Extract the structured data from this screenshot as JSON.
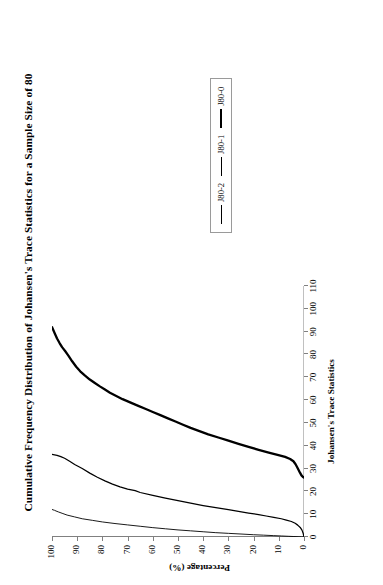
{
  "chart_data": {
    "type": "line",
    "title": "Cumulative Frequency Distribution of Johansen's Trace Statistics for a Sample Size of 80",
    "xlabel": "Johansen's Trace Statistics",
    "ylabel": "Percentage (%)",
    "xlim": [
      0,
      110
    ],
    "ylim": [
      0,
      100
    ],
    "xticks": [
      0,
      10,
      20,
      30,
      40,
      50,
      60,
      70,
      80,
      90,
      100,
      110
    ],
    "yticks": [
      0,
      10,
      20,
      30,
      40,
      50,
      60,
      70,
      80,
      90,
      100
    ],
    "grid": false,
    "legend_position": "right",
    "orientation": "rotated-90-ccw",
    "series": [
      {
        "name": "J80-2",
        "style": "thin",
        "x": [
          0.0,
          0.05,
          0.1,
          0.2,
          0.3,
          0.45,
          0.6,
          0.8,
          1.0,
          1.3,
          1.6,
          1.9,
          2.3,
          2.7,
          3.1,
          3.6,
          4.1,
          4.7,
          5.3,
          5.9,
          6.6,
          7.3,
          8.0,
          8.8,
          9.6,
          10.4,
          11.0,
          11.4,
          11.7,
          11.9,
          12.1
        ],
        "y": [
          0,
          1,
          2,
          4,
          6,
          9,
          12,
          16,
          20,
          25,
          30,
          35,
          40,
          45,
          50,
          55,
          60,
          65,
          70,
          75,
          80,
          84,
          88,
          91,
          94,
          96,
          97.5,
          98.4,
          99.0,
          99.6,
          100
        ]
      },
      {
        "name": "J80-1",
        "style": "medium",
        "x": [
          0.0,
          1.5,
          3.0,
          4.2,
          5.2,
          6.0,
          6.8,
          7.4,
          8.0,
          8.6,
          9.2,
          9.8,
          10.5,
          11.2,
          12.0,
          12.9,
          13.8,
          14.8,
          15.9,
          17.0,
          18.2,
          19.5,
          20.3,
          21.0,
          22.0,
          23.2,
          24.6,
          26.2,
          28.0,
          30.0,
          31.8,
          33.2,
          34.5,
          35.2,
          35.8,
          36.2
        ],
        "y": [
          0,
          0.3,
          0.8,
          1.5,
          2.5,
          3.5,
          5,
          7,
          9,
          12,
          15,
          18,
          22,
          26,
          30,
          35,
          40,
          45,
          50,
          55,
          60,
          65,
          67,
          70,
          73,
          76,
          79,
          82,
          85,
          88,
          91,
          93,
          95,
          96.5,
          98,
          100
        ]
      },
      {
        "name": "J80-0",
        "style": "thick",
        "x": [
          26.0,
          26.3,
          27.0,
          28.2,
          29.5,
          30.8,
          32.0,
          33.2,
          34.2,
          35.1,
          36.0,
          37.0,
          38.2,
          39.5,
          40.8,
          42.2,
          43.6,
          45.0,
          46.4,
          47.8,
          49.2,
          50.6,
          52.0,
          53.4,
          54.8,
          56.2,
          57.6,
          59.0,
          60.4,
          61.8,
          63.2,
          64.6,
          66.0,
          67.5,
          69.0,
          70.8,
          72.6,
          74.6,
          77.0,
          79.5,
          81.5,
          83.2,
          85.0,
          87.0,
          89.0,
          90.5,
          91.5,
          92.0
        ],
        "y": [
          0,
          0.4,
          1.0,
          1.6,
          2.2,
          2.8,
          3.4,
          4.2,
          5.5,
          7.5,
          10.5,
          14,
          18,
          22,
          26,
          30,
          34,
          38,
          41.5,
          45,
          48,
          51,
          54,
          57,
          60,
          63,
          66,
          69,
          72,
          74.5,
          77,
          79,
          81,
          83,
          85,
          87,
          88.8,
          90.4,
          92,
          93.5,
          94.8,
          96,
          97,
          98,
          98.8,
          99.4,
          99.8,
          100
        ]
      }
    ]
  },
  "legend": {
    "entries": [
      {
        "label": "J80-2"
      },
      {
        "label": "J80-1"
      },
      {
        "label": "J80-0"
      }
    ]
  },
  "colors": {
    "line": "#000000",
    "axis": "#808080",
    "legend_border": "#9a9a9a",
    "background": "#ffffff"
  }
}
